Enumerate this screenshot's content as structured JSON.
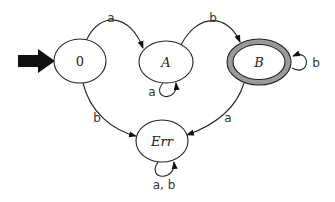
{
  "diagram": {
    "type": "finite-automaton",
    "start_state": "0",
    "accepting_states": [
      "B"
    ],
    "states": {
      "s0": {
        "label": "0"
      },
      "sA": {
        "label": "A"
      },
      "sB": {
        "label": "B"
      },
      "sErr": {
        "label": "Err"
      }
    },
    "transitions": {
      "t0A": {
        "from": "0",
        "to": "A",
        "label": "a"
      },
      "tAA": {
        "from": "A",
        "to": "A",
        "label": "a"
      },
      "tAB": {
        "from": "A",
        "to": "B",
        "label": "b"
      },
      "tBB": {
        "from": "B",
        "to": "B",
        "label": "b"
      },
      "t0Err": {
        "from": "0",
        "to": "Err",
        "label": "b"
      },
      "tBErr": {
        "from": "B",
        "to": "Err",
        "label": "a"
      },
      "tErrErr": {
        "from": "Err",
        "to": "Err",
        "label": "a, b"
      }
    },
    "colors": {
      "stroke": "#222222",
      "accepting_ring": "#9a9a9a",
      "start_arrow": "#111111",
      "background": "#ffffff"
    }
  }
}
